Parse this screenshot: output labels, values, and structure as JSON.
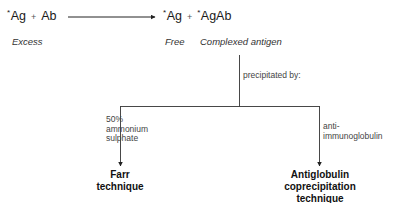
{
  "reaction": {
    "left": {
      "star": "*",
      "antigen": "Ag",
      "plus": "+",
      "antibody": "Ab"
    },
    "right": {
      "star1": "*",
      "free_antigen": "Ag",
      "plus": "+",
      "star2": "*",
      "complex": "AgAb"
    }
  },
  "captions": {
    "excess": "Excess",
    "free": "Free",
    "complexed": "Complexed antigen"
  },
  "branch_label": "precipitated by:",
  "branches": [
    {
      "reagent_line1": "50%",
      "reagent_line2": "ammonium",
      "reagent_line3": "sulphate",
      "technique_line1": "Farr",
      "technique_line2": "technique"
    },
    {
      "reagent_line1": "anti-",
      "reagent_line2": "immunoglobulin",
      "technique_line1": "Antiglobulin",
      "technique_line2": "coprecipitation",
      "technique_line3": "technique"
    }
  ],
  "colors": {
    "line": "#222222",
    "text": "#1a1a1a"
  }
}
